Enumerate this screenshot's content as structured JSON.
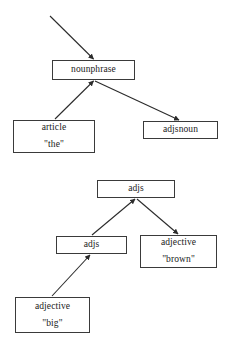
{
  "diagram": {
    "background_color": "#ffffff",
    "line_color": "#2b2b2b",
    "box_border_color": "#3a3a3a",
    "text_color": "#1a1a1a"
  },
  "trees": [
    {
      "name": "nounphrase-tree",
      "nodes": [
        {
          "id": "nounphrase",
          "label": "nounphrase",
          "lexeme": "",
          "x": 52,
          "y": 60,
          "w": 83,
          "h": 20
        },
        {
          "id": "article",
          "label": "article",
          "lexeme": "\"the\"",
          "x": 13,
          "y": 120,
          "w": 82,
          "h": 33
        },
        {
          "id": "adjsnoun",
          "label": "adjsnoun",
          "lexeme": "",
          "x": 143,
          "y": 121,
          "w": 75,
          "h": 18
        }
      ],
      "edges": [
        {
          "id": "external-to-nounphrase",
          "from": "external",
          "to": "nounphrase",
          "arrowhead": "to"
        },
        {
          "id": "article-to-nounphrase",
          "from": "article",
          "to": "nounphrase",
          "arrowhead": "to"
        },
        {
          "id": "nounphrase-to-adjsnoun",
          "from": "nounphrase",
          "to": "adjsnoun",
          "arrowhead": "to"
        }
      ]
    },
    {
      "name": "adjs-tree",
      "nodes": [
        {
          "id": "adjs-top",
          "label": "adjs",
          "lexeme": "",
          "x": 97,
          "y": 180,
          "w": 78,
          "h": 18
        },
        {
          "id": "adjs-mid",
          "label": "adjs",
          "lexeme": "",
          "x": 56,
          "y": 236,
          "w": 71,
          "h": 18
        },
        {
          "id": "adjective-brown",
          "label": "adjective",
          "lexeme": "\"brown\"",
          "x": 140,
          "y": 235,
          "w": 77,
          "h": 33
        },
        {
          "id": "adjective-big",
          "label": "adjective",
          "lexeme": "\"big\"",
          "x": 15,
          "y": 297,
          "w": 75,
          "h": 36
        }
      ],
      "edges": [
        {
          "id": "adjsmid-to-adjstop",
          "from": "adjs-mid",
          "to": "adjs-top",
          "arrowhead": "to"
        },
        {
          "id": "adjstop-to-adjectivebrown",
          "from": "adjs-top",
          "to": "adjective-brown",
          "arrowhead": "to"
        },
        {
          "id": "adjectivebig-to-adjsmid",
          "from": "adjective-big",
          "to": "adjs-mid",
          "arrowhead": "to"
        }
      ]
    }
  ]
}
